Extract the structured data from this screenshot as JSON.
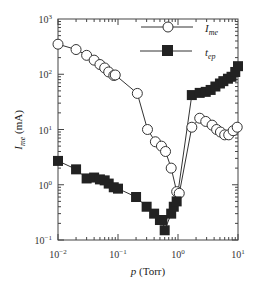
{
  "chart_data": {
    "type": "scatter",
    "title": "",
    "xlabel": "p (Torr)",
    "ylabel": "I_me (mA)",
    "xscale": "log",
    "yscale": "log",
    "xlim": [
      0.01,
      10
    ],
    "ylim": [
      0.1,
      1000
    ],
    "x_ticks": [
      "10^-2",
      "10^-1",
      "10^0",
      "10^1"
    ],
    "y_ticks": [
      "10^-1",
      "10^0",
      "10^1",
      "10^2",
      "10^3"
    ],
    "grid": false,
    "legend_position": "upper right",
    "series": [
      {
        "name": "I_me",
        "marker": "open-circle",
        "points": [
          [
            0.01,
            350
          ],
          [
            0.02,
            280
          ],
          [
            0.03,
            220
          ],
          [
            0.04,
            180
          ],
          [
            0.05,
            150
          ],
          [
            0.06,
            130
          ],
          [
            0.07,
            110
          ],
          [
            0.085,
            95
          ],
          [
            0.09,
            97
          ],
          [
            0.21,
            45
          ],
          [
            0.31,
            10
          ],
          [
            0.42,
            6
          ],
          [
            0.53,
            5
          ],
          [
            0.62,
            4
          ],
          [
            0.77,
            2
          ],
          [
            0.95,
            0.75
          ],
          [
            1.05,
            0.7
          ],
          [
            1.7,
            11
          ],
          [
            2.3,
            16
          ],
          [
            2.9,
            14
          ],
          [
            3.7,
            12
          ],
          [
            4.4,
            10
          ],
          [
            5.1,
            9
          ],
          [
            6.0,
            8
          ],
          [
            7.0,
            8
          ],
          [
            8.3,
            9.5
          ],
          [
            9.7,
            11
          ]
        ]
      },
      {
        "name": "t_ep",
        "marker": "filled-square",
        "points": [
          [
            0.01,
            2.7
          ],
          [
            0.02,
            1.9
          ],
          [
            0.03,
            1.3
          ],
          [
            0.04,
            1.35
          ],
          [
            0.05,
            1.25
          ],
          [
            0.06,
            1.2
          ],
          [
            0.07,
            1.05
          ],
          [
            0.085,
            0.9
          ],
          [
            0.1,
            0.85
          ],
          [
            0.2,
            0.6
          ],
          [
            0.3,
            0.4
          ],
          [
            0.4,
            0.3
          ],
          [
            0.5,
            0.23
          ],
          [
            0.55,
            0.23
          ],
          [
            0.6,
            0.15
          ],
          [
            0.77,
            0.3
          ],
          [
            0.85,
            0.4
          ],
          [
            0.95,
            0.5
          ],
          [
            1.7,
            42
          ],
          [
            2.3,
            46
          ],
          [
            2.9,
            48
          ],
          [
            3.5,
            52
          ],
          [
            4.2,
            60
          ],
          [
            5.0,
            68
          ],
          [
            5.7,
            75
          ],
          [
            6.8,
            83
          ],
          [
            7.8,
            90
          ],
          [
            9.0,
            110
          ],
          [
            10,
            140
          ]
        ]
      }
    ],
    "legend": [
      {
        "label": "I_me",
        "marker": "open-circle"
      },
      {
        "label": "t_ep",
        "marker": "filled-square"
      }
    ]
  },
  "axes": {
    "x_tick_labels": [
      {
        "base": "10",
        "exp": "−2"
      },
      {
        "base": "10",
        "exp": "−1"
      },
      {
        "base": "10",
        "exp": "0"
      },
      {
        "base": "10",
        "exp": "1"
      }
    ],
    "y_tick_labels": [
      {
        "base": "10",
        "exp": "3"
      },
      {
        "base": "10",
        "exp": "2"
      },
      {
        "base": "10",
        "exp": "1"
      },
      {
        "base": "10",
        "exp": "0"
      },
      {
        "base": "10",
        "exp": "−1"
      }
    ],
    "xlabel_var": "p",
    "xlabel_unit": " (Torr)",
    "ylabel_var": "I",
    "ylabel_sub": "me",
    "ylabel_unit": " (mA)"
  },
  "legend": {
    "item1": {
      "var": "I",
      "sub": "me"
    },
    "item2": {
      "var": "t",
      "sub": "ep"
    }
  },
  "colors": {
    "line": "#333333",
    "marker_fill": "#222222",
    "background": "#ffffff"
  }
}
